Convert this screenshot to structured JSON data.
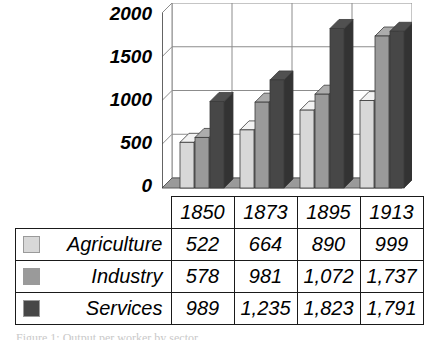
{
  "chart_data": {
    "type": "bar",
    "title": "",
    "subtitle": "",
    "xlabel": "",
    "ylabel": "",
    "categories": [
      "1850",
      "1873",
      "1895",
      "1913"
    ],
    "series": [
      {
        "name": "Agriculture",
        "color": "#d8d8d8",
        "values": [
          522,
          664,
          890,
          999
        ]
      },
      {
        "name": "Industry",
        "color": "#9a9a9a",
        "values": [
          578,
          981,
          1072,
          1737
        ]
      },
      {
        "name": "Services",
        "color": "#474747",
        "values": [
          989,
          1235,
          1823,
          1791
        ]
      }
    ],
    "ylim": [
      0,
      2000
    ],
    "yticks": [
      0,
      500,
      1000,
      1500,
      2000
    ],
    "ytick_labels": [
      "0",
      "500",
      "1000",
      "1500",
      "2000"
    ],
    "grid": true,
    "legend_position": "table-left",
    "three_d": true,
    "annotations": []
  },
  "table": {
    "year_headers": [
      "1850",
      "1873",
      "1895",
      "1913"
    ],
    "rows": [
      {
        "swatch": "agriculture-swatch",
        "label": "Agriculture",
        "values": [
          "522",
          "664",
          "890",
          "999"
        ]
      },
      {
        "swatch": "industry-swatch",
        "label": "Industry",
        "values": [
          "578",
          "981",
          "1,072",
          "1,737"
        ]
      },
      {
        "swatch": "services-swatch",
        "label": "Services",
        "values": [
          "989",
          "1,235",
          "1,823",
          "1,791"
        ]
      }
    ]
  },
  "axis": {
    "ytick_labels": [
      "2000",
      "1500",
      "1000",
      "500",
      "0"
    ]
  },
  "caption": {
    "text": "Figure 1: Output per worker by sector"
  },
  "colors": {
    "agriculture": "#d8d8d8",
    "industry": "#9a9a9a",
    "services": "#474747",
    "axis": "#1a1a1a",
    "grid": "#8c8c8c",
    "floor": "#9a9a9a"
  }
}
